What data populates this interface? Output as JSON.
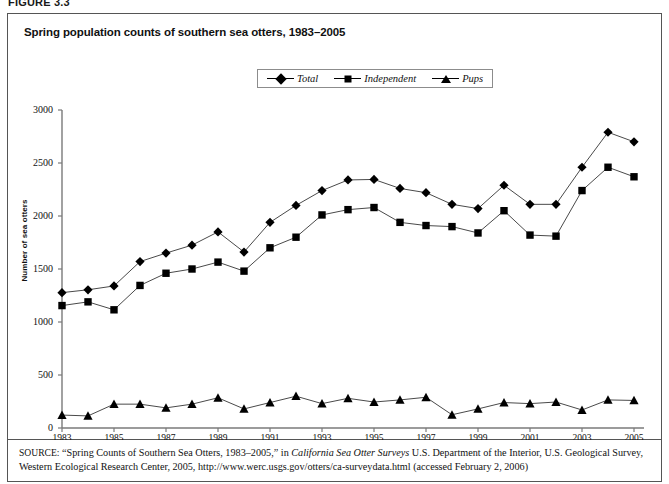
{
  "figure": {
    "number": "FIGURE 3.3"
  },
  "chart": {
    "title": "Spring population counts of southern sea otters, 1983–2005"
  },
  "source": {
    "label": "SOURCE:",
    "part1": " “Spring Counts of Southern Sea Otters, 1983–2005,” in ",
    "italic1": "California Sea Otter Surveys",
    "part2": " U.S. Department of the Interior, U.S. Geological Survey, Western Ecological Research Center, 2005, http://www.werc.usgs.gov/otters/ca-surveydata.html (accessed February 2, 2006)"
  },
  "legend": {
    "position": "top-center",
    "items": [
      {
        "label": "Total",
        "marker": "diamond-marker",
        "color": "#000000"
      },
      {
        "label": "Independent",
        "marker": "square-marker",
        "color": "#000000"
      },
      {
        "label": "Pups",
        "marker": "triangle-marker",
        "color": "#000000"
      }
    ]
  },
  "chart_data": {
    "type": "line",
    "title": "Spring population counts of southern sea otters, 1983–2005",
    "xlabel": "",
    "ylabel": "Number of sea otters",
    "x": [
      1983,
      1984,
      1985,
      1986,
      1987,
      1988,
      1989,
      1990,
      1991,
      1992,
      1993,
      1994,
      1995,
      1996,
      1997,
      1998,
      1999,
      2000,
      2001,
      2002,
      2003,
      2004,
      2005
    ],
    "xlim": [
      1983,
      2005
    ],
    "ylim": [
      0,
      3000
    ],
    "yticks": [
      0,
      500,
      1000,
      1500,
      2000,
      2500,
      3000
    ],
    "xticks": [
      1983,
      1985,
      1987,
      1989,
      1991,
      1993,
      1995,
      1997,
      1999,
      2001,
      2003,
      2005
    ],
    "xtick_labels": [
      "1983",
      "1985",
      "1987",
      "1989",
      "1991",
      "1993",
      "1995",
      "1997",
      "1999",
      "2001",
      "2003",
      "2005"
    ],
    "ytick_labels": [
      "0",
      "500",
      "1000",
      "1500",
      "2000",
      "2500",
      "3000"
    ],
    "grid": false,
    "series": [
      {
        "name": "Total",
        "marker": "diamond-marker",
        "color": "#000000",
        "values": [
          1277,
          1304,
          1340,
          1570,
          1650,
          1725,
          1850,
          1660,
          1940,
          2100,
          2240,
          2340,
          2345,
          2260,
          2220,
          2110,
          2070,
          2290,
          2110,
          2110,
          2460,
          2790,
          2700
        ]
      },
      {
        "name": "Independent",
        "marker": "square-marker",
        "color": "#000000",
        "values": [
          1155,
          1190,
          1115,
          1345,
          1460,
          1500,
          1565,
          1480,
          1700,
          1800,
          2010,
          2060,
          2080,
          1940,
          1910,
          1900,
          1840,
          2050,
          1820,
          1810,
          2240,
          2460,
          2370
        ]
      },
      {
        "name": "Pups",
        "marker": "triangle-marker",
        "color": "#000000",
        "values": [
          122,
          114,
          225,
          225,
          190,
          225,
          285,
          180,
          240,
          300,
          230,
          280,
          245,
          265,
          290,
          125,
          180,
          240,
          230,
          245,
          170,
          265,
          260
        ]
      }
    ]
  }
}
